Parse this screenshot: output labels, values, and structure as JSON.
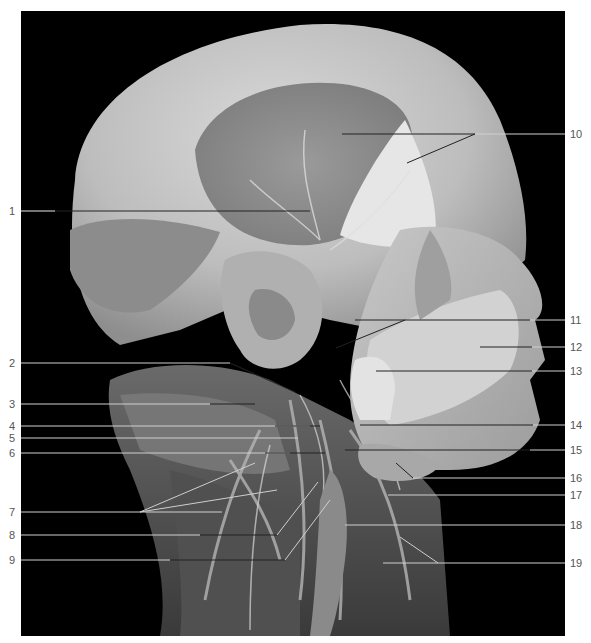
{
  "figure": {
    "background_color": "#000000",
    "page_color": "#ffffff",
    "label_color": "#555555"
  },
  "labels": {
    "left": [
      {
        "num": "1",
        "y": 211
      },
      {
        "num": "2",
        "y": 363
      },
      {
        "num": "3",
        "y": 404
      },
      {
        "num": "4",
        "y": 426
      },
      {
        "num": "5",
        "y": 438
      },
      {
        "num": "6",
        "y": 453
      },
      {
        "num": "7",
        "y": 512
      },
      {
        "num": "8",
        "y": 535
      },
      {
        "num": "9",
        "y": 560
      }
    ],
    "right": [
      {
        "num": "10",
        "y": 134
      },
      {
        "num": "11",
        "y": 320
      },
      {
        "num": "12",
        "y": 347
      },
      {
        "num": "13",
        "y": 371
      },
      {
        "num": "14",
        "y": 425
      },
      {
        "num": "15",
        "y": 450
      },
      {
        "num": "16",
        "y": 478
      },
      {
        "num": "17",
        "y": 495
      },
      {
        "num": "18",
        "y": 525
      },
      {
        "num": "19",
        "y": 563
      }
    ]
  }
}
